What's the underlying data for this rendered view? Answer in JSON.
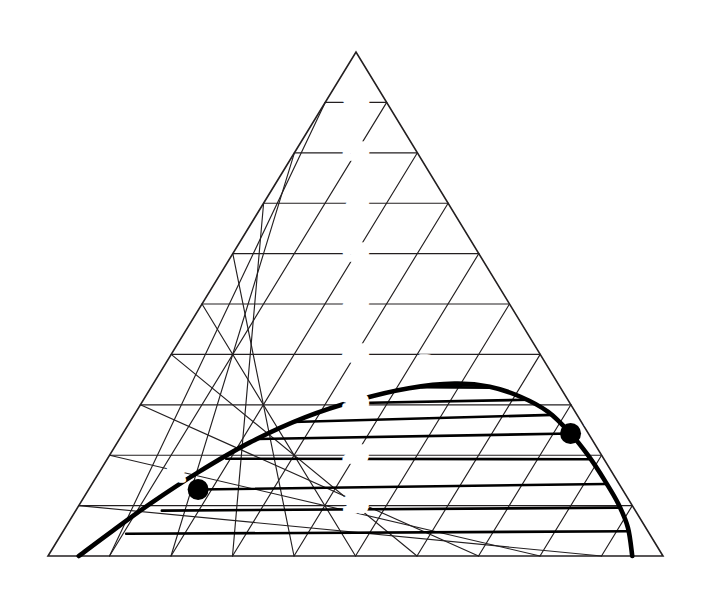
{
  "figure": {
    "kind": "ternary-phase-diagram",
    "title": "",
    "background_color": "#ffffff",
    "line_color": "#231f20",
    "curve_color": "#000000"
  },
  "vertices": {
    "left": "A",
    "right": "B",
    "top": "C"
  },
  "axes": {
    "left_axis_label": "",
    "right_axis_label": "",
    "bottom_axis_label": "",
    "left_ticks": [
      "10",
      "20",
      "30",
      "40",
      "50",
      "60",
      "70",
      "80",
      "90"
    ],
    "center_ticks": [
      "90",
      "80",
      "70",
      "60",
      "50",
      "40",
      "30",
      "20",
      "10"
    ],
    "bottom_ticks": [
      "0",
      "10",
      "20",
      "30",
      "40",
      "50",
      "60",
      "70",
      "80",
      "90",
      "100"
    ],
    "bottom_letter_ticks": [
      {
        "label": "J",
        "value": 5
      },
      {
        "label": "K",
        "value": 95
      }
    ]
  },
  "points": [
    {
      "label": "P",
      "x_pct": 46.5,
      "y_pct": 34.5,
      "marker": false,
      "note": "plait point region label"
    },
    {
      "label": "R",
      "x_pct": 17.8,
      "y_pct": 13.2,
      "marker": true
    },
    {
      "label": "E",
      "x_pct": 72.8,
      "y_pct": 24.3,
      "marker": true
    }
  ],
  "chart_data": {
    "type": "line",
    "title": "",
    "xlabel": "",
    "ylabel": "",
    "coordinate_system": "ternary",
    "components": [
      "A",
      "B",
      "C"
    ],
    "grid": true,
    "grid_interval": 10,
    "axis_range": [
      0,
      100
    ],
    "legend": "none",
    "series": [
      {
        "name": "binodal-curve",
        "kind": "solubility-envelope",
        "points_bc": [
          [
            5.0,
            0.0
          ],
          [
            8.0,
            5.0
          ],
          [
            11.5,
            10.5
          ],
          [
            16.0,
            16.5
          ],
          [
            21.5,
            22.5
          ],
          [
            28.0,
            27.5
          ],
          [
            35.0,
            31.0
          ],
          [
            42.0,
            33.3
          ],
          [
            49.0,
            34.2
          ],
          [
            55.0,
            33.6
          ],
          [
            61.0,
            31.6
          ],
          [
            67.0,
            28.6
          ],
          [
            72.8,
            24.3
          ],
          [
            78.0,
            19.8
          ],
          [
            83.0,
            15.0
          ],
          [
            87.5,
            10.4
          ],
          [
            91.5,
            5.6
          ],
          [
            95.0,
            0.0
          ]
        ]
      },
      {
        "name": "tie-lines",
        "kind": "conjugate-chords",
        "lines_bc": [
          [
            [
              44.0,
              33.5
            ],
            [
              55.5,
              33.4
            ]
          ],
          [
            [
              33.0,
              30.3
            ],
            [
              62.5,
              31.0
            ]
          ],
          [
            [
              26.5,
              26.6
            ],
            [
              68.0,
              28.0
            ]
          ],
          [
            [
              22.5,
              23.2
            ],
            [
              72.8,
              24.3
            ]
          ],
          [
            [
              19.3,
              19.3
            ],
            [
              78.5,
              19.2
            ]
          ],
          [
            [
              17.8,
              13.2
            ],
            [
              83.5,
              14.3
            ]
          ],
          [
            [
              14.0,
              9.0
            ],
            [
              88.0,
              9.6
            ]
          ],
          [
            [
              10.5,
              4.4
            ],
            [
              92.0,
              4.9
            ]
          ]
        ]
      }
    ],
    "annotations": [
      {
        "text": "P",
        "bc": [
          46.5,
          34.5
        ]
      },
      {
        "text": "R",
        "bc": [
          17.8,
          13.2
        ]
      },
      {
        "text": "E",
        "bc": [
          72.8,
          24.3
        ]
      },
      {
        "text": "J",
        "bc": [
          5.0,
          0.0
        ]
      },
      {
        "text": "K",
        "bc": [
          95.0,
          0.0
        ]
      }
    ]
  }
}
